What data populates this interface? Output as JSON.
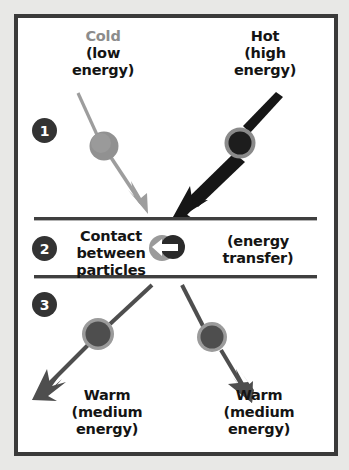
{
  "diagram": {
    "type": "process-diagram",
    "frame": {
      "border_color": "#3a3a3a",
      "background": "#ffffff",
      "page_background": "#e8e8e6"
    },
    "steps": [
      {
        "number": "1",
        "badge_label": "1",
        "labels": [
          {
            "id": "cold",
            "heading": "Cold",
            "detail_line1": "(low",
            "detail_line2": "energy)",
            "heading_color": "#8c8c8c",
            "detail_color": "#141414"
          },
          {
            "id": "hot",
            "heading": "Hot",
            "detail_line1": "(high",
            "detail_line2": "energy)",
            "heading_color": "#141414",
            "detail_color": "#141414"
          }
        ]
      },
      {
        "number": "2",
        "badge_label": "2",
        "labels": [
          {
            "id": "contact",
            "line1": "Contact",
            "line2": "between",
            "line3": "particles",
            "color": "#141414"
          },
          {
            "id": "energy-transfer",
            "line1": "(energy",
            "line2": "transfer)",
            "color": "#141414"
          }
        ],
        "icon": "energy-transfer-icon"
      },
      {
        "number": "3",
        "badge_label": "3",
        "labels": [
          {
            "id": "warm-left",
            "heading": "Warm",
            "detail_line1": "(medium",
            "detail_line2": "energy)",
            "color": "#141414"
          },
          {
            "id": "warm-right",
            "heading": "Warm",
            "detail_line1": "(medium",
            "detail_line2": "energy)",
            "color": "#141414"
          }
        ]
      }
    ],
    "particles": [
      {
        "id": "cold-particle",
        "step": "1",
        "cx": 104,
        "cy": 146,
        "r": 14,
        "fill": "#8f8f8f",
        "ring": "none"
      },
      {
        "id": "hot-particle",
        "step": "1",
        "cx": 240,
        "cy": 143,
        "r": 15,
        "fill": "#1f1f1f",
        "ring": "#8a8a8a"
      },
      {
        "id": "warm-particle-left",
        "step": "3",
        "cx": 98,
        "cy": 334,
        "r": 15,
        "fill": "#4e4e4e",
        "ring": "#9b9b9b"
      },
      {
        "id": "warm-particle-right",
        "step": "3",
        "cx": 212,
        "cy": 337,
        "r": 14,
        "fill": "#4e4e4e",
        "ring": "#9b9b9b"
      }
    ],
    "arrows": [
      {
        "id": "cold-arrow",
        "step": "1",
        "color": "#9a9a9a",
        "weight": "thin",
        "direction": "down-right"
      },
      {
        "id": "hot-arrow",
        "step": "1",
        "color": "#1a1a1a",
        "weight": "thick",
        "direction": "down-left"
      },
      {
        "id": "warm-arrow-left",
        "step": "3",
        "color": "#4e4e4e",
        "weight": "medium",
        "direction": "down-left"
      },
      {
        "id": "warm-arrow-right",
        "step": "3",
        "color": "#4e4e4e",
        "weight": "medium",
        "direction": "down-right"
      }
    ],
    "dividers": [
      {
        "id": "divider-top",
        "y": 219,
        "color": "#3f3f3f"
      },
      {
        "id": "divider-bottom",
        "y": 277,
        "color": "#3f3f3f"
      }
    ],
    "colors": {
      "cold": "#8c8c8c",
      "hot": "#1f1f1f",
      "warm": "#4e4e4e",
      "text": "#141414",
      "frame": "#3a3a3a"
    }
  }
}
